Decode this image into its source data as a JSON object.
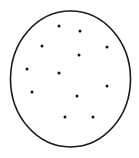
{
  "canvas": {
    "width": 139,
    "height": 158,
    "background": "#ffffff"
  },
  "ellipse": {
    "cx": 70.5,
    "cy": 79,
    "rx": 60,
    "ry": 68,
    "stroke": "#1a1a1a",
    "stroke_width": 1.6,
    "fill": "none"
  },
  "dot_style": {
    "r": 1.5,
    "fill": "#111111"
  },
  "dots": [
    {
      "x": 59,
      "y": 26
    },
    {
      "x": 80,
      "y": 31
    },
    {
      "x": 42,
      "y": 46
    },
    {
      "x": 107,
      "y": 47
    },
    {
      "x": 79,
      "y": 55
    },
    {
      "x": 27,
      "y": 69
    },
    {
      "x": 59,
      "y": 73
    },
    {
      "x": 107,
      "y": 86
    },
    {
      "x": 32,
      "y": 92
    },
    {
      "x": 77,
      "y": 96
    },
    {
      "x": 65,
      "y": 117
    },
    {
      "x": 93,
      "y": 117
    }
  ],
  "dot_count": 12
}
